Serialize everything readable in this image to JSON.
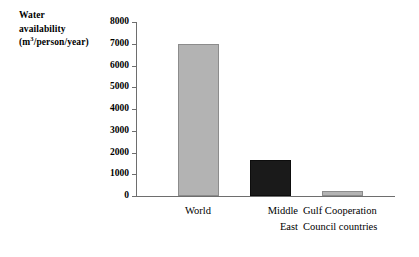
{
  "chart_data": {
    "type": "bar",
    "title": "",
    "ylabel_lines": [
      "Water",
      "availability",
      "(m3/person/year)"
    ],
    "ylabel_unit_base": "(m",
    "ylabel_unit_sup": "3",
    "ylabel_unit_rest": "/person/year)",
    "xlabel": "",
    "categories": [
      "World",
      "Middle East",
      "Gulf Cooperation Council countries"
    ],
    "category_lines": [
      [
        "World"
      ],
      [
        "Middle",
        "East"
      ],
      [
        "Gulf Cooperation",
        "Council countries"
      ]
    ],
    "values": [
      7000,
      1650,
      250
    ],
    "ylim": [
      0,
      8000
    ],
    "ytick_step": 1000,
    "yticks": [
      0,
      1000,
      2000,
      3000,
      4000,
      5000,
      6000,
      7000,
      8000
    ],
    "ytick_labels": [
      "0",
      "1000",
      "2000",
      "3000",
      "4000",
      "5000",
      "6000",
      "7000",
      "8000"
    ],
    "grid": false,
    "legend": null,
    "bar_colors": [
      "#b3b3b3",
      "#1a1a1a",
      "#b3b3b3"
    ],
    "colors": {
      "axis": "#6e6e6e",
      "gray_bar_fill": "#b3b3b3",
      "gray_bar_edge": "#8c8c8c",
      "black_bar_fill": "#1a1a1a",
      "background": "#ffffff",
      "text": "#000000"
    }
  }
}
